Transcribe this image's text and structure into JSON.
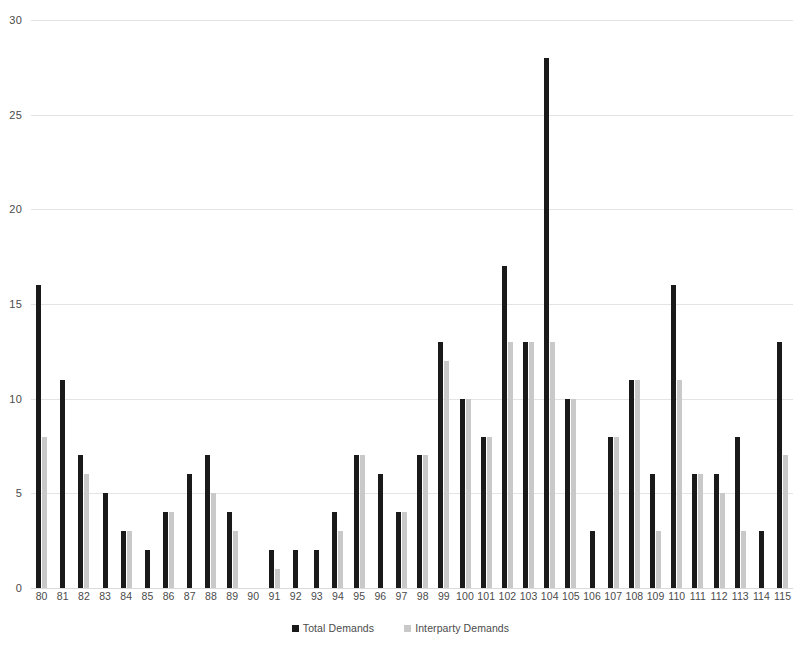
{
  "chart_data": {
    "type": "bar",
    "title": "",
    "subtitle": "",
    "xlabel": "",
    "ylabel": "",
    "ylim": [
      0,
      30
    ],
    "ytick_step": 5,
    "yticks": [
      "30",
      "25",
      "20",
      "15",
      "10",
      "5",
      "0"
    ],
    "grid": true,
    "legend_position": "bottom",
    "orientation": "vertical",
    "grouping": "clustered",
    "categories": [
      "80",
      "81",
      "82",
      "83",
      "84",
      "85",
      "86",
      "87",
      "88",
      "89",
      "90",
      "91",
      "92",
      "93",
      "94",
      "95",
      "96",
      "97",
      "98",
      "99",
      "100",
      "101",
      "102",
      "103",
      "104",
      "105",
      "106",
      "107",
      "108",
      "109",
      "110",
      "111",
      "112",
      "113",
      "114",
      "115"
    ],
    "series": [
      {
        "name": "Total Demands",
        "color": "#1a1a1a",
        "values": [
          16,
          11,
          7,
          5,
          3,
          2,
          4,
          6,
          7,
          4,
          0,
          2,
          2,
          2,
          4,
          7,
          6,
          4,
          7,
          13,
          10,
          8,
          17,
          13,
          28,
          10,
          3,
          8,
          11,
          6,
          16,
          6,
          6,
          8,
          3,
          13
        ]
      },
      {
        "name": "Interparty Demands",
        "color": "#c9c9c9",
        "values": [
          8,
          0,
          6,
          0,
          3,
          0,
          4,
          0,
          5,
          3,
          0,
          1,
          0,
          0,
          3,
          7,
          0,
          4,
          7,
          12,
          10,
          8,
          13,
          13,
          13,
          10,
          0,
          8,
          11,
          3,
          11,
          6,
          5,
          3,
          0,
          7
        ]
      }
    ]
  },
  "legend": {
    "items": [
      {
        "label": "Total Demands",
        "swatch": "black-square-swatch"
      },
      {
        "label": "Interparty Demands",
        "swatch": "gray-square-swatch"
      }
    ]
  }
}
